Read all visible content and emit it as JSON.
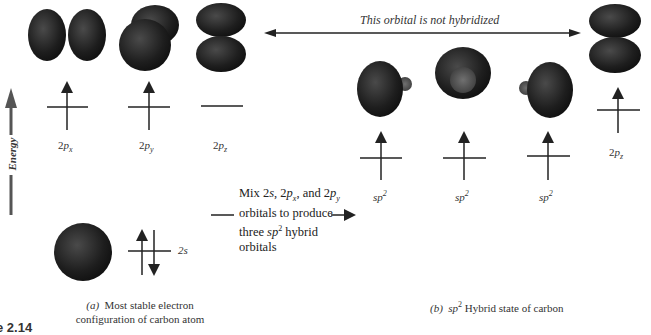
{
  "banner": {
    "text": "This orbital is not hybridized"
  },
  "energy_axis": {
    "label": "Energy"
  },
  "panel_a": {
    "p_orbitals": [
      {
        "label_main": "2",
        "label_var": "p",
        "label_sub": "x",
        "electrons": 1
      },
      {
        "label_main": "2",
        "label_var": "p",
        "label_sub": "y",
        "electrons": 1
      },
      {
        "label_main": "2",
        "label_var": "p",
        "label_sub": "z",
        "electrons": 0
      }
    ],
    "s_orbital": {
      "label": "2s",
      "electrons": 2
    },
    "caption_prefix": "(a)",
    "caption_line1": "Most stable electron",
    "caption_line2": "configuration of carbon atom"
  },
  "mix_text": {
    "line1_a": "Mix 2",
    "line1_s": "s",
    "line1_b": ", 2",
    "line1_p1": "p",
    "line1_x": "x",
    "line1_c": ", and 2",
    "line1_p2": "p",
    "line1_y": "y",
    "line2": "orbitals to produce",
    "line3_a": "three ",
    "line3_sp": "sp",
    "line3_sup": "2",
    "line3_b": " hybrid",
    "line4": "orbitals"
  },
  "panel_b": {
    "hybrid_orbitals": [
      {
        "label": "sp",
        "sup": "2",
        "electrons": 1
      },
      {
        "label": "sp",
        "sup": "2",
        "electrons": 1
      },
      {
        "label": "sp",
        "sup": "2",
        "electrons": 1
      }
    ],
    "unhybridized": {
      "label_main": "2",
      "label_var": "p",
      "label_sub": "z",
      "electrons": 1
    },
    "caption_prefix": "(b)",
    "caption_sp": "sp",
    "caption_sup": "2",
    "caption_rest": " Hybrid state of carbon"
  },
  "figure_number": "e 2.14",
  "colors": {
    "orbital": "#1e1e1e",
    "orbital_highlight": "#4a4a4a",
    "energy_arrow": "#555555",
    "line": "#222222"
  }
}
